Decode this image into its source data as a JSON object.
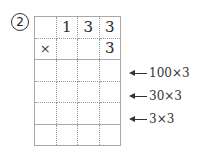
{
  "problem": {
    "number": "2",
    "grid": [
      [
        "",
        "1",
        "3",
        "3"
      ],
      [
        "×",
        "",
        "",
        "3"
      ],
      [
        "",
        "",
        "",
        ""
      ],
      [
        "",
        "",
        "",
        ""
      ],
      [
        "",
        "",
        "",
        ""
      ],
      [
        "",
        "",
        "",
        ""
      ]
    ],
    "annotations": [
      {
        "row": 2,
        "text": "100×3",
        "icon": "left-arrow-icon"
      },
      {
        "row": 3,
        "text": "30×3",
        "icon": "left-arrow-icon"
      },
      {
        "row": 4,
        "text": "3×3",
        "icon": "left-arrow-icon"
      }
    ]
  }
}
